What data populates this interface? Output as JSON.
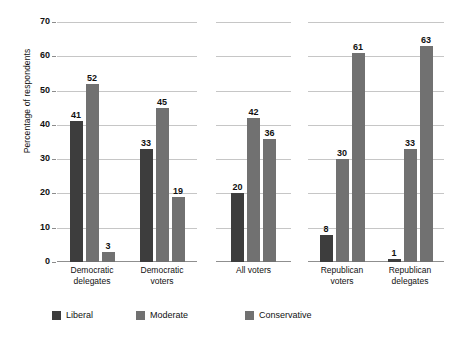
{
  "chart_data": {
    "type": "bar",
    "title": "",
    "subtitle": "",
    "xlabel": "",
    "ylabel": "Percentage of respondents",
    "ylim": [
      0,
      70
    ],
    "yticks": [
      0,
      10,
      20,
      30,
      40,
      50,
      60,
      70
    ],
    "ytick_labels": [
      "0",
      "10",
      "20",
      "30",
      "40",
      "50",
      "60",
      "70"
    ],
    "grid": "horizontal",
    "legend_position": "bottom",
    "categories": [
      "Democratic\ndelegates",
      "Democratic\nvoters",
      "All voters",
      "Republican\nvoters",
      "Republican\ndelegates"
    ],
    "series": [
      {
        "name": "Liberal",
        "color": "#3d3d3d",
        "values": [
          41,
          33,
          20,
          8,
          1
        ]
      },
      {
        "name": "Moderate",
        "color": "#717171",
        "values": [
          52,
          45,
          42,
          30,
          33
        ]
      },
      {
        "name": "Conservative",
        "color": "#717171",
        "values": [
          3,
          19,
          36,
          61,
          63
        ]
      }
    ],
    "panels": [
      {
        "id": "panel-democrats",
        "groups": [
          {
            "label": "Democratic\ndelegates",
            "bars": [
              {
                "series": "Liberal",
                "value": 41,
                "label": "41"
              },
              {
                "series": "Moderate",
                "value": 52,
                "label": "52"
              },
              {
                "series": "Conservative",
                "value": 3,
                "label": "3"
              }
            ]
          },
          {
            "label": "Democratic\nvoters",
            "bars": [
              {
                "series": "Liberal",
                "value": 33,
                "label": "33"
              },
              {
                "series": "Moderate",
                "value": 45,
                "label": "45"
              },
              {
                "series": "Conservative",
                "value": 19,
                "label": "19"
              }
            ]
          }
        ]
      },
      {
        "id": "panel-all-voters",
        "groups": [
          {
            "label": "All voters",
            "bars": [
              {
                "series": "Liberal",
                "value": 20,
                "label": "20"
              },
              {
                "series": "Moderate",
                "value": 42,
                "label": "42"
              },
              {
                "series": "Conservative",
                "value": 36,
                "label": "36"
              }
            ]
          }
        ]
      },
      {
        "id": "panel-republicans",
        "groups": [
          {
            "label": "Republican\nvoters",
            "bars": [
              {
                "series": "Liberal",
                "value": 8,
                "label": "8"
              },
              {
                "series": "Moderate",
                "value": 30,
                "label": "30"
              },
              {
                "series": "Conservative",
                "value": 61,
                "label": "61"
              }
            ]
          },
          {
            "label": "Republican\ndelegates",
            "bars": [
              {
                "series": "Liberal",
                "value": 1,
                "label": "1"
              },
              {
                "series": "Moderate",
                "value": 33,
                "label": "33"
              },
              {
                "series": "Conservative",
                "value": 63,
                "label": "63"
              }
            ]
          }
        ]
      }
    ]
  },
  "legend": {
    "items": [
      {
        "label": "Liberal",
        "color": "#3d3d3d"
      },
      {
        "label": "Moderate",
        "color": "#717171"
      },
      {
        "label": "Conservative",
        "color": "#717171"
      }
    ]
  },
  "colors": {
    "liberal": "#3d3d3d",
    "moderate": "#717171",
    "conservative": "#717171",
    "gridline": "#c6c6c6",
    "baseline": "#8f8f8f",
    "text": "#111111",
    "background": "#ffffff"
  }
}
